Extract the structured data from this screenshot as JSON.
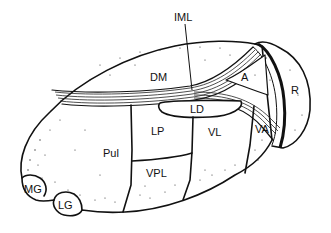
{
  "diagram": {
    "labels": {
      "iml": "IML",
      "dm": "DM",
      "a": "A",
      "r": "R",
      "ld": "LD",
      "lp": "LP",
      "vl": "VL",
      "va": "VA",
      "pul": "Pul",
      "vpl": "VPL",
      "mg": "MG",
      "lg": "LG"
    },
    "colors": {
      "ink": "#111111",
      "background": "#ffffff"
    }
  }
}
